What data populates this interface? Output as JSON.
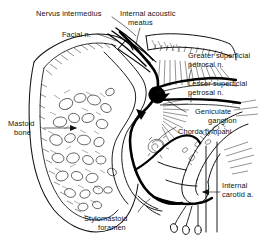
{
  "figure": {
    "type": "anatomical-line-drawing",
    "background_color": "#ffffff",
    "ink_color": "#111111",
    "nerve_color": "#000000"
  },
  "labels": {
    "nervus_intermedius": "Nervus intermedius",
    "internal_acoustic_meatus_line1": "Internal acoustic",
    "internal_acoustic_meatus_line2": "meatus",
    "facial_n": "Facial n.",
    "greater_petrosal_line1": "Greater superficial",
    "greater_petrosal_line2": "petrosal n.",
    "lesser_petrosal_line1": "Lesser superficial",
    "lesser_petrosal_line2": "petrosal n.",
    "geniculate_line1": "Geniculate",
    "geniculate_line2": "ganglion",
    "chorda_tympani": "Chorda tympani",
    "mastoid_line1": "Mastoid",
    "mastoid_line2": "bone",
    "internal_carotid_line1": "Internal",
    "internal_carotid_line2": "carotid a.",
    "stylomastoid_line1": "Stylomastoid",
    "stylomastoid_line2": "foramen"
  }
}
